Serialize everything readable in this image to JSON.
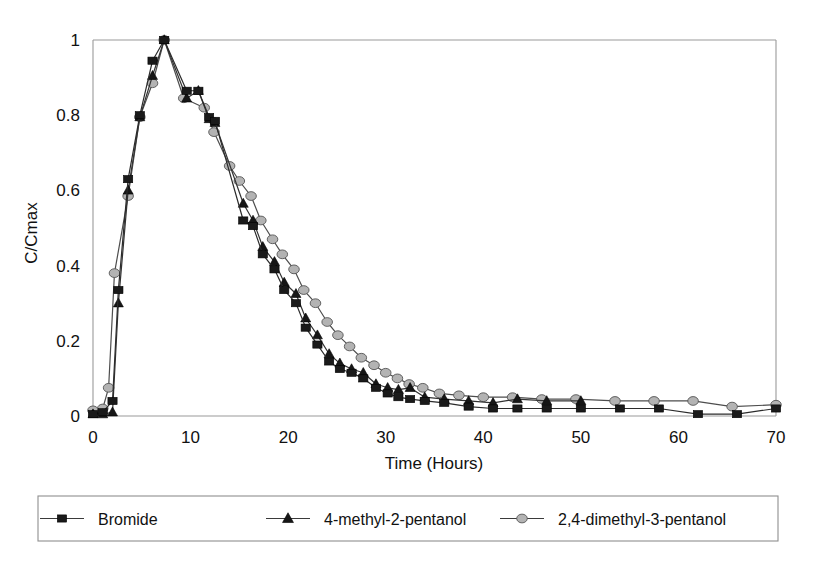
{
  "chart_data": {
    "type": "line",
    "title": "",
    "subtitle": "",
    "xlabel": "Time (Hours)",
    "ylabel": "C/Cmax",
    "xlim": [
      0,
      70
    ],
    "ylim": [
      0,
      1
    ],
    "xticks": [
      0,
      10,
      20,
      30,
      40,
      50,
      60,
      70
    ],
    "xtick_labels": [
      "0",
      "10",
      "20",
      "30",
      "40",
      "50",
      "60",
      "70"
    ],
    "yticks": [
      0,
      0.2,
      0.4,
      0.6,
      0.8,
      1
    ],
    "ytick_labels": [
      "0",
      "0.2",
      "0.4",
      "0.6",
      "0.8",
      "1"
    ],
    "grid": false,
    "legend_position": "below-plot",
    "series": [
      {
        "name": "Bromide",
        "marker": "square",
        "marker_color": "#1a1a1a",
        "line_color": "#2b2b2b",
        "points": [
          {
            "x": 0.0,
            "y": 0.005
          },
          {
            "x": 1.0,
            "y": 0.01
          },
          {
            "x": 2.0,
            "y": 0.04
          },
          {
            "x": 2.6,
            "y": 0.335
          },
          {
            "x": 3.6,
            "y": 0.63
          },
          {
            "x": 4.8,
            "y": 0.8
          },
          {
            "x": 6.1,
            "y": 0.945
          },
          {
            "x": 7.3,
            "y": 1.0
          },
          {
            "x": 9.6,
            "y": 0.865
          },
          {
            "x": 10.8,
            "y": 0.865
          },
          {
            "x": 11.9,
            "y": 0.795
          },
          {
            "x": 12.5,
            "y": 0.785
          },
          {
            "x": 15.4,
            "y": 0.52
          },
          {
            "x": 16.4,
            "y": 0.505
          },
          {
            "x": 17.4,
            "y": 0.43
          },
          {
            "x": 18.6,
            "y": 0.39
          },
          {
            "x": 19.6,
            "y": 0.335
          },
          {
            "x": 20.8,
            "y": 0.3
          },
          {
            "x": 21.8,
            "y": 0.235
          },
          {
            "x": 23.0,
            "y": 0.19
          },
          {
            "x": 24.2,
            "y": 0.145
          },
          {
            "x": 25.3,
            "y": 0.125
          },
          {
            "x": 26.5,
            "y": 0.115
          },
          {
            "x": 27.7,
            "y": 0.1
          },
          {
            "x": 29.0,
            "y": 0.075
          },
          {
            "x": 30.2,
            "y": 0.06
          },
          {
            "x": 31.3,
            "y": 0.05
          },
          {
            "x": 32.5,
            "y": 0.045
          },
          {
            "x": 34.0,
            "y": 0.04
          },
          {
            "x": 36.0,
            "y": 0.035
          },
          {
            "x": 38.5,
            "y": 0.025
          },
          {
            "x": 41.0,
            "y": 0.02
          },
          {
            "x": 43.5,
            "y": 0.02
          },
          {
            "x": 46.5,
            "y": 0.02
          },
          {
            "x": 50.0,
            "y": 0.02
          },
          {
            "x": 54.0,
            "y": 0.02
          },
          {
            "x": 58.0,
            "y": 0.02
          },
          {
            "x": 62.0,
            "y": 0.005
          },
          {
            "x": 66.0,
            "y": 0.005
          },
          {
            "x": 70.0,
            "y": 0.02
          }
        ]
      },
      {
        "name": "4-methyl-2-pentanol",
        "marker": "triangle",
        "marker_color": "#161616",
        "line_color": "#333333",
        "points": [
          {
            "x": 0.0,
            "y": 0.005
          },
          {
            "x": 1.0,
            "y": 0.005
          },
          {
            "x": 2.0,
            "y": 0.01
          },
          {
            "x": 2.6,
            "y": 0.3
          },
          {
            "x": 3.6,
            "y": 0.6
          },
          {
            "x": 4.8,
            "y": 0.795
          },
          {
            "x": 6.1,
            "y": 0.905
          },
          {
            "x": 7.3,
            "y": 1.0
          },
          {
            "x": 9.6,
            "y": 0.845
          },
          {
            "x": 10.8,
            "y": 0.865
          },
          {
            "x": 11.9,
            "y": 0.79
          },
          {
            "x": 12.5,
            "y": 0.78
          },
          {
            "x": 15.4,
            "y": 0.565
          },
          {
            "x": 16.4,
            "y": 0.52
          },
          {
            "x": 17.4,
            "y": 0.45
          },
          {
            "x": 18.6,
            "y": 0.41
          },
          {
            "x": 19.6,
            "y": 0.355
          },
          {
            "x": 20.8,
            "y": 0.325
          },
          {
            "x": 21.8,
            "y": 0.26
          },
          {
            "x": 23.0,
            "y": 0.215
          },
          {
            "x": 24.2,
            "y": 0.165
          },
          {
            "x": 25.3,
            "y": 0.14
          },
          {
            "x": 26.5,
            "y": 0.125
          },
          {
            "x": 27.7,
            "y": 0.115
          },
          {
            "x": 29.0,
            "y": 0.085
          },
          {
            "x": 30.2,
            "y": 0.075
          },
          {
            "x": 31.3,
            "y": 0.07
          },
          {
            "x": 32.5,
            "y": 0.075
          },
          {
            "x": 34.0,
            "y": 0.05
          },
          {
            "x": 36.0,
            "y": 0.045
          },
          {
            "x": 38.5,
            "y": 0.04
          },
          {
            "x": 41.0,
            "y": 0.035
          },
          {
            "x": 43.5,
            "y": 0.045
          },
          {
            "x": 46.5,
            "y": 0.04
          },
          {
            "x": 50.0,
            "y": 0.04
          }
        ]
      },
      {
        "name": "2,4-dimethyl-3-pentanol",
        "marker": "circle",
        "marker_color": "#b3b3b3",
        "line_color": "#4d4d4d",
        "points": [
          {
            "x": 0.0,
            "y": 0.015
          },
          {
            "x": 1.0,
            "y": 0.02
          },
          {
            "x": 1.6,
            "y": 0.075
          },
          {
            "x": 2.2,
            "y": 0.38
          },
          {
            "x": 3.6,
            "y": 0.585
          },
          {
            "x": 4.8,
            "y": 0.795
          },
          {
            "x": 6.1,
            "y": 0.885
          },
          {
            "x": 7.3,
            "y": 1.0
          },
          {
            "x": 9.3,
            "y": 0.845
          },
          {
            "x": 11.4,
            "y": 0.82
          },
          {
            "x": 12.4,
            "y": 0.755
          },
          {
            "x": 14.0,
            "y": 0.665
          },
          {
            "x": 15.0,
            "y": 0.625
          },
          {
            "x": 16.2,
            "y": 0.585
          },
          {
            "x": 17.2,
            "y": 0.52
          },
          {
            "x": 18.4,
            "y": 0.47
          },
          {
            "x": 19.4,
            "y": 0.43
          },
          {
            "x": 20.6,
            "y": 0.39
          },
          {
            "x": 21.6,
            "y": 0.335
          },
          {
            "x": 22.8,
            "y": 0.3
          },
          {
            "x": 24.0,
            "y": 0.25
          },
          {
            "x": 25.1,
            "y": 0.215
          },
          {
            "x": 26.3,
            "y": 0.185
          },
          {
            "x": 27.5,
            "y": 0.155
          },
          {
            "x": 28.8,
            "y": 0.135
          },
          {
            "x": 30.0,
            "y": 0.115
          },
          {
            "x": 31.2,
            "y": 0.1
          },
          {
            "x": 32.4,
            "y": 0.085
          },
          {
            "x": 33.8,
            "y": 0.075
          },
          {
            "x": 35.5,
            "y": 0.06
          },
          {
            "x": 37.5,
            "y": 0.055
          },
          {
            "x": 40.0,
            "y": 0.05
          },
          {
            "x": 43.0,
            "y": 0.05
          },
          {
            "x": 46.0,
            "y": 0.045
          },
          {
            "x": 49.5,
            "y": 0.045
          },
          {
            "x": 53.5,
            "y": 0.04
          },
          {
            "x": 57.5,
            "y": 0.04
          },
          {
            "x": 61.5,
            "y": 0.04
          },
          {
            "x": 65.5,
            "y": 0.025
          },
          {
            "x": 70.0,
            "y": 0.03
          }
        ]
      }
    ]
  },
  "legend": {
    "items": [
      {
        "label": "Bromide",
        "marker": "square",
        "color": "#1a1a1a"
      },
      {
        "label": "4-methyl-2-pentanol",
        "marker": "triangle",
        "color": "#161616"
      },
      {
        "label": "2,4-dimethyl-3-pentanol",
        "marker": "circle",
        "color": "#b3b3b3"
      }
    ]
  }
}
